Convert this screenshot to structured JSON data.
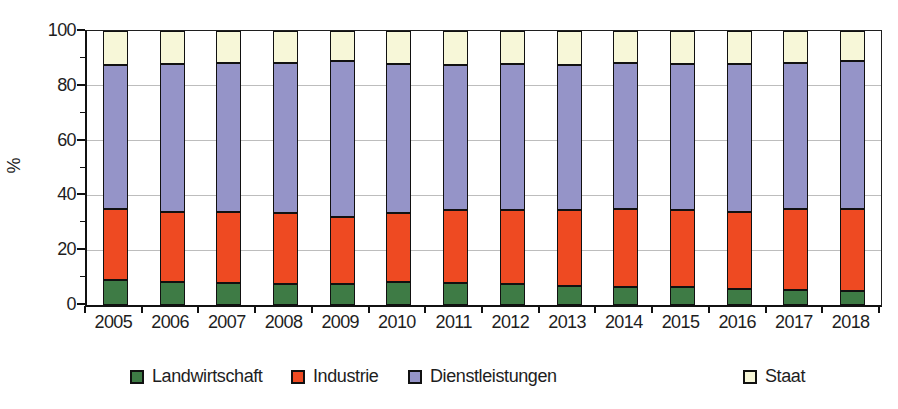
{
  "figure": {
    "background": "#ffffff",
    "text_color": "#1e1e1e",
    "grid_color": "#bdbdbd",
    "axis_color": "#111111"
  },
  "chart_data": {
    "type": "bar",
    "stacked": true,
    "title": "",
    "xlabel": "",
    "ylabel": "%",
    "ylim": [
      0,
      100
    ],
    "yticks": [
      0,
      20,
      40,
      60,
      80,
      100
    ],
    "minor_yticks": [
      10,
      30,
      50,
      70,
      90
    ],
    "grid": true,
    "legend_position": "bottom",
    "categories": [
      "2005",
      "2006",
      "2007",
      "2008",
      "2009",
      "2010",
      "2011",
      "2012",
      "2013",
      "2014",
      "2015",
      "2016",
      "2017",
      "2018"
    ],
    "series": [
      {
        "name": "Landwirtschaft",
        "color": "#3e7b45",
        "values": [
          9.0,
          8.5,
          8.0,
          7.5,
          7.5,
          8.5,
          8.0,
          7.5,
          7.0,
          6.5,
          6.5,
          6.0,
          5.5,
          5.0
        ]
      },
      {
        "name": "Industrie",
        "color": "#ee4a22",
        "values": [
          26.0,
          25.5,
          26.0,
          26.0,
          24.5,
          25.0,
          26.5,
          27.0,
          27.5,
          28.5,
          28.0,
          28.0,
          29.5,
          30.0
        ]
      },
      {
        "name": "Dienstleistungen",
        "color": "#9594c8",
        "values": [
          52.5,
          54.0,
          54.5,
          55.0,
          57.0,
          54.5,
          53.0,
          53.5,
          53.0,
          53.5,
          53.5,
          54.0,
          53.5,
          54.0
        ]
      },
      {
        "name": "Staat",
        "color": "#f7f7d8",
        "values": [
          12.5,
          12.0,
          11.5,
          11.5,
          11.0,
          12.0,
          12.5,
          12.0,
          12.5,
          11.5,
          12.0,
          12.0,
          11.5,
          11.0
        ]
      }
    ]
  }
}
